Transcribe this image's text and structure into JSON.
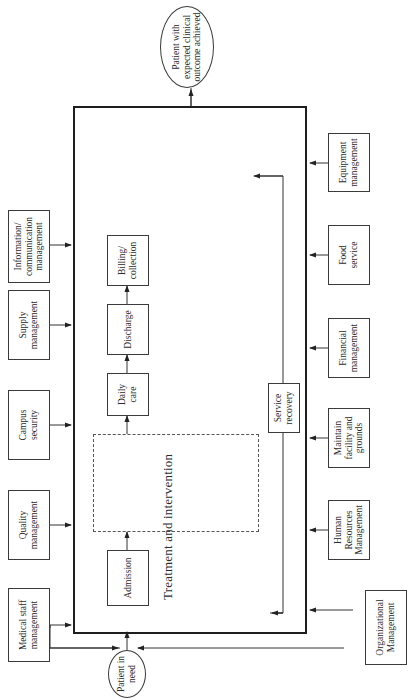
{
  "diagram": {
    "orientation": "rotated-90-counterclockwise",
    "start_node": "Patient in need",
    "end_node": "Patient with expected clinical outcome achieved",
    "process_flow": {
      "admission": "Admission",
      "treatment": {
        "title": "Treatment and intervention",
        "items": [
          "Medication administration",
          "Physical therapy treatment",
          "Diagnostic and therapeutic imaging",
          "intervention",
          "Lab testing",
          "Cardiology treatment intervention",
          "Pulmonary treatment intervention",
          "Surgical intervention",
          "IV therapy treatment",
          "Nutritional support",
          "Discharge teaching",
          "Physiological monitoring",
          "Implementation of treatments",
          "Communication",
          "Comfort management"
        ]
      },
      "daily_care": "Daily care",
      "discharge": "Discharge",
      "billing": "Billing/ collection",
      "service_recovery": "Service recovery"
    },
    "support_top": [
      "Medical staff management",
      "Quality management",
      "Campus security",
      "Supply management",
      "Information/ communication management"
    ],
    "support_bottom": [
      "Organizational Management",
      "Human Resources Management",
      "Maintain facility and grounds",
      "Financial management",
      "Food service",
      "Equipment management"
    ]
  }
}
